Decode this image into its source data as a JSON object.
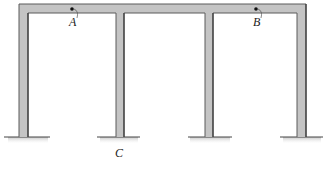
{
  "diagram": {
    "type": "structural-frame",
    "colors": {
      "member_fill": "#c4c4c4",
      "member_edge": "#555555",
      "ground_line": "#444444",
      "ground_hatch": "#bbbbbb",
      "point": "#111111"
    },
    "beam": {
      "x1": 19,
      "x2": 306,
      "y_top": 4,
      "y_bottom": 13
    },
    "columns": [
      {
        "id": "col-1",
        "x1": 19,
        "x2": 28
      },
      {
        "id": "col-2",
        "x1": 116,
        "x2": 124
      },
      {
        "id": "col-3",
        "x1": 205,
        "x2": 213
      },
      {
        "id": "col-4",
        "x1": 297,
        "x2": 306
      }
    ],
    "ground_y": 137,
    "supports": [
      {
        "id": "support-1",
        "x1": 4,
        "x2": 50
      },
      {
        "id": "support-2",
        "x1": 97,
        "x2": 140
      },
      {
        "id": "support-3",
        "x1": 188,
        "x2": 232
      },
      {
        "id": "support-4",
        "x1": 280,
        "x2": 323
      }
    ],
    "points": [
      {
        "id": "point-a",
        "label": "A",
        "x": 72,
        "y": 9,
        "label_x": 69,
        "label_y": 26
      },
      {
        "id": "point-b",
        "label": "B",
        "x": 256,
        "y": 9,
        "label_x": 253,
        "label_y": 26
      }
    ],
    "labels": [
      {
        "id": "label-c",
        "text": "C",
        "x": 115,
        "y": 157
      }
    ]
  }
}
